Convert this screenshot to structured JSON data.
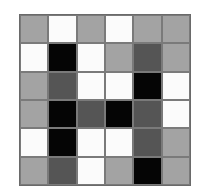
{
  "grid": {
    "rows": 6,
    "cols": 6,
    "legend": {
      "white": "#fbfbfb",
      "light": "#a3a3a3",
      "dark": "#555555",
      "black": "#050505"
    },
    "cells": [
      [
        "light",
        "white",
        "light",
        "white",
        "light",
        "light"
      ],
      [
        "white",
        "black",
        "white",
        "light",
        "dark",
        "light"
      ],
      [
        "light",
        "dark",
        "white",
        "white",
        "black",
        "white"
      ],
      [
        "light",
        "black",
        "dark",
        "black",
        "dark",
        "white"
      ],
      [
        "white",
        "black",
        "white",
        "white",
        "dark",
        "light"
      ],
      [
        "light",
        "dark",
        "white",
        "light",
        "black",
        "light"
      ]
    ]
  }
}
